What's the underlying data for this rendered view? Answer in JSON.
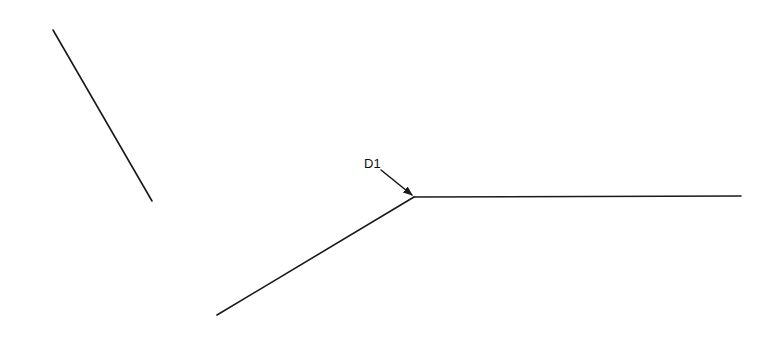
{
  "diagram": {
    "lines": [
      {
        "id": "isolated-segment",
        "x1": 53,
        "y1": 30,
        "x2": 152,
        "y2": 201
      },
      {
        "id": "lower-left-branch",
        "x1": 217,
        "y1": 315,
        "x2": 414,
        "y2": 197
      },
      {
        "id": "horizontal-branch",
        "x1": 414,
        "y1": 197,
        "x2": 741,
        "y2": 196
      }
    ],
    "junction": {
      "x": 414,
      "y": 197
    },
    "callout": {
      "label": "D1",
      "label_x": 364,
      "label_y": 168,
      "leader": {
        "x1": 381,
        "y1": 170,
        "x2": 412,
        "y2": 195
      }
    },
    "colors": {
      "stroke": "#1a1a1a",
      "background": "#ffffff"
    }
  }
}
